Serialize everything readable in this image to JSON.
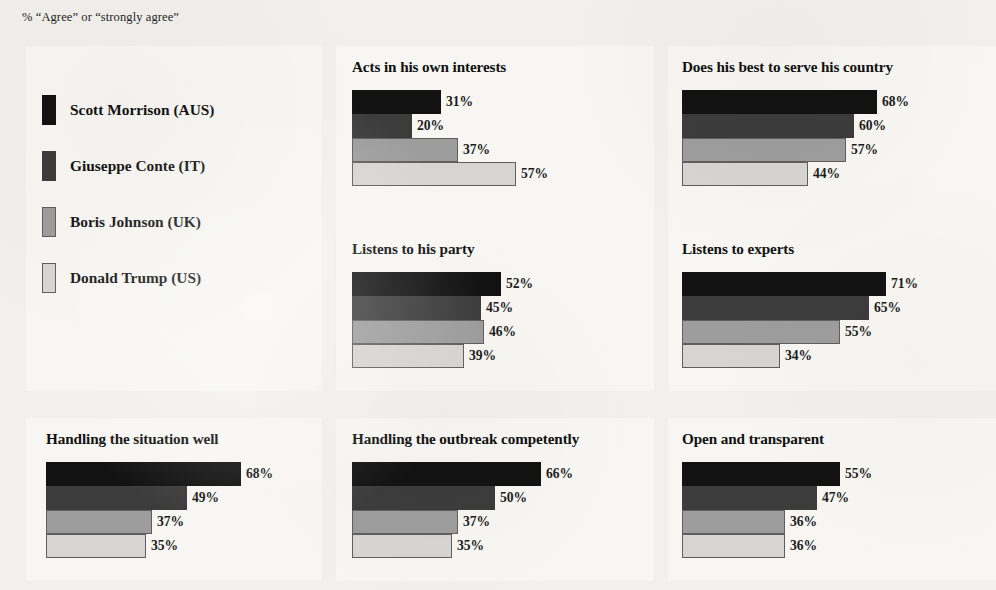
{
  "subtitle": "% “Agree” or “strongly agree”",
  "legend": {
    "items": [
      {
        "label": "Scott Morrison (AUS)",
        "color": "#121212"
      },
      {
        "label": "Giuseppe Conte (IT)",
        "color": "#3c3c3c"
      },
      {
        "label": "Boris Johnson (UK)",
        "color": "#9d9d9d"
      },
      {
        "label": "Donald Trump (US)",
        "color": "#d6d5d1"
      }
    ]
  },
  "chart_data": [
    {
      "type": "bar",
      "title": "Acts in his own interests",
      "xlabel": "",
      "ylabel": "",
      "xlim": [
        0,
        100
      ],
      "grid": false,
      "orientation": "horizontal",
      "categories": [
        "Scott Morrison (AUS)",
        "Giuseppe Conte (IT)",
        "Boris Johnson (UK)",
        "Donald Trump (US)"
      ],
      "values": [
        31,
        20,
        37,
        57
      ],
      "labels": [
        "31%",
        "20%",
        "37%",
        "57%"
      ],
      "bar_px": [
        89,
        60,
        106,
        164
      ]
    },
    {
      "type": "bar",
      "title": "Does his best to serve his country",
      "xlabel": "",
      "ylabel": "",
      "xlim": [
        0,
        100
      ],
      "grid": false,
      "orientation": "horizontal",
      "categories": [
        "Scott Morrison (AUS)",
        "Giuseppe Conte (IT)",
        "Boris Johnson (UK)",
        "Donald Trump (US)"
      ],
      "values": [
        68,
        60,
        57,
        44
      ],
      "labels": [
        "68%",
        "60%",
        "57%",
        "44%"
      ],
      "bar_px": [
        195,
        172,
        164,
        126
      ]
    },
    {
      "type": "bar",
      "title": "Listens to his party",
      "xlabel": "",
      "ylabel": "",
      "xlim": [
        0,
        100
      ],
      "grid": false,
      "orientation": "horizontal",
      "categories": [
        "Scott Morrison (AUS)",
        "Giuseppe Conte (IT)",
        "Boris Johnson (UK)",
        "Donald Trump (US)"
      ],
      "values": [
        52,
        45,
        46,
        39
      ],
      "labels": [
        "52%",
        "45%",
        "46%",
        "39%"
      ],
      "bar_px": [
        149,
        129,
        132,
        112
      ]
    },
    {
      "type": "bar",
      "title": "Listens to experts",
      "xlabel": "",
      "ylabel": "",
      "xlim": [
        0,
        100
      ],
      "grid": false,
      "orientation": "horizontal",
      "categories": [
        "Scott Morrison (AUS)",
        "Giuseppe Conte (IT)",
        "Boris Johnson (UK)",
        "Donald Trump (US)"
      ],
      "values": [
        71,
        65,
        55,
        34
      ],
      "labels": [
        "71%",
        "65%",
        "55%",
        "34%"
      ],
      "bar_px": [
        204,
        187,
        158,
        98
      ]
    },
    {
      "type": "bar",
      "title": "Handling the situation well",
      "xlabel": "",
      "ylabel": "",
      "xlim": [
        0,
        100
      ],
      "grid": false,
      "orientation": "horizontal",
      "categories": [
        "Scott Morrison (AUS)",
        "Giuseppe Conte (IT)",
        "Boris Johnson (UK)",
        "Donald Trump (US)"
      ],
      "values": [
        68,
        49,
        37,
        35
      ],
      "labels": [
        "68%",
        "49%",
        "37%",
        "35%"
      ],
      "bar_px": [
        195,
        141,
        106,
        100
      ]
    },
    {
      "type": "bar",
      "title": "Handling the outbreak competently",
      "xlabel": "",
      "ylabel": "",
      "xlim": [
        0,
        100
      ],
      "grid": false,
      "orientation": "horizontal",
      "categories": [
        "Scott Morrison (AUS)",
        "Giuseppe Conte (IT)",
        "Boris Johnson (UK)",
        "Donald Trump (US)"
      ],
      "values": [
        66,
        50,
        37,
        35
      ],
      "labels": [
        "66%",
        "50%",
        "37%",
        "35%"
      ],
      "bar_px": [
        189,
        143,
        106,
        100
      ]
    },
    {
      "type": "bar",
      "title": "Open and transparent",
      "xlabel": "",
      "ylabel": "",
      "xlim": [
        0,
        100
      ],
      "grid": false,
      "orientation": "horizontal",
      "categories": [
        "Scott Morrison (AUS)",
        "Giuseppe Conte (IT)",
        "Boris Johnson (UK)",
        "Donald Trump (US)"
      ],
      "values": [
        55,
        47,
        36,
        36
      ],
      "labels": [
        "55%",
        "47%",
        "36%",
        "36%"
      ],
      "bar_px": [
        158,
        135,
        103,
        103
      ]
    }
  ]
}
